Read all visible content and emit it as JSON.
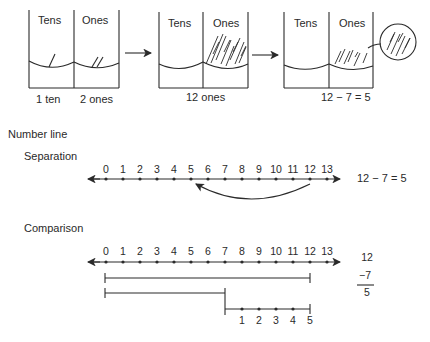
{
  "place_value": {
    "containers": [
      {
        "col1": "Tens",
        "col2": "Ones",
        "caption": "1 ten   2 ones",
        "caption_tens": "1 ten",
        "caption_ones": "2 ones"
      },
      {
        "col1": "Tens",
        "col2": "Ones",
        "caption": "12 ones"
      },
      {
        "col1": "Tens",
        "col2": "Ones",
        "caption": "12 − 7 = 5"
      }
    ]
  },
  "number_line": {
    "heading": "Number line",
    "separation": {
      "label": "Separation",
      "ticks": [
        "0",
        "1",
        "2",
        "3",
        "4",
        "5",
        "6",
        "7",
        "8",
        "9",
        "10",
        "11",
        "12",
        "13"
      ],
      "arc_from": 12,
      "arc_to": 5,
      "equation": "12 − 7 = 5"
    },
    "comparison": {
      "label": "Comparison",
      "ticks": [
        "0",
        "1",
        "2",
        "3",
        "4",
        "5",
        "6",
        "7",
        "8",
        "9",
        "10",
        "11",
        "12",
        "13"
      ],
      "bar1": {
        "from": 0,
        "to": 12
      },
      "bar2": {
        "from": 0,
        "to": 7
      },
      "difference_ticks": [
        "1",
        "2",
        "3",
        "4",
        "5"
      ],
      "vertical": {
        "top": "12",
        "middle": "−7",
        "bottom": "5"
      }
    }
  }
}
